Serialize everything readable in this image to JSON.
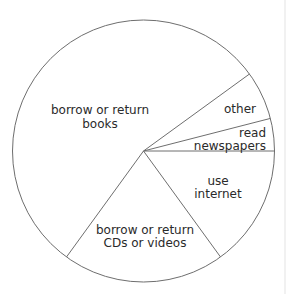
{
  "chart_data": {
    "type": "pie",
    "title": "",
    "start_angle_deg": 0,
    "direction": "counterclockwise",
    "slices": [
      {
        "label": "read newspapers",
        "value": 4
      },
      {
        "label": "other",
        "value": 6
      },
      {
        "label": "borrow or return books",
        "value": 55
      },
      {
        "label": "borrow or return CDs or videos",
        "value": 20
      },
      {
        "label": "use internet",
        "value": 15
      }
    ],
    "legend": "none",
    "labels_inside": true
  },
  "labels": {
    "books": [
      "borrow or return",
      "books"
    ],
    "other": [
      "other"
    ],
    "newspapers": [
      "read",
      "newspapers"
    ],
    "internet": [
      "use",
      "internet"
    ],
    "cds": [
      "borrow or return",
      "CDs or videos"
    ]
  },
  "style": {
    "stroke": "#6e6e6e",
    "fill": "#ffffff"
  }
}
